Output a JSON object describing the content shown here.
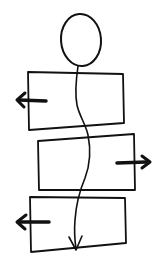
{
  "diagram": {
    "colors": {
      "ink": "#111111",
      "background": "#ffffff"
    },
    "head": {
      "shape": "circle",
      "cx": 81,
      "cy": 40,
      "rx": 20,
      "ry": 26
    },
    "boxes": [
      {
        "id": "box-1",
        "points": [
          [
            28,
            72
          ],
          [
            123,
            74
          ],
          [
            124,
            123
          ],
          [
            29,
            130
          ]
        ],
        "side_arrow": "left"
      },
      {
        "id": "box-2",
        "points": [
          [
            38,
            141
          ],
          [
            134,
            134
          ],
          [
            135,
            190
          ],
          [
            39,
            190
          ]
        ],
        "side_arrow": "right"
      },
      {
        "id": "box-3",
        "points": [
          [
            30,
            197
          ],
          [
            125,
            198
          ],
          [
            126,
            243
          ],
          [
            31,
            252
          ]
        ],
        "side_arrow": "left"
      }
    ],
    "side_arrows": [
      {
        "id": "arrow-left-1",
        "direction": "left",
        "from": [
          46,
          100
        ],
        "to": [
          16,
          100
        ]
      },
      {
        "id": "arrow-right-2",
        "direction": "right",
        "from": [
          117,
          162
        ],
        "to": [
          150,
          162
        ]
      },
      {
        "id": "arrow-left-3",
        "direction": "left",
        "from": [
          49,
          222
        ],
        "to": [
          16,
          222
        ]
      }
    ],
    "flow_line": {
      "direction": "down",
      "end": [
        76,
        249
      ],
      "labels": []
    }
  }
}
